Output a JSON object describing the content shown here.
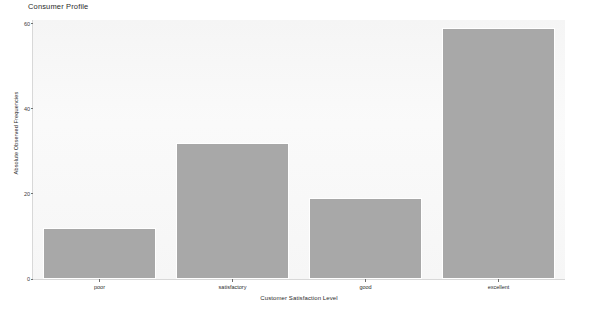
{
  "chart_data": {
    "type": "bar",
    "title": "Consumer Profile",
    "xlabel": "Customer Satisfaction Level",
    "ylabel": "Absolute Observed Frequencies",
    "categories": [
      "poor",
      "satisfactory",
      "good",
      "excellent"
    ],
    "values": [
      12,
      32,
      19,
      59
    ],
    "yticks": [
      0,
      20,
      40,
      60
    ],
    "ytick_labels": [
      "0",
      "20",
      "40",
      "60"
    ],
    "ylim": [
      0,
      60.9
    ],
    "grid": false,
    "legend": false,
    "bar_color": "#a8a8a8",
    "bar_edge_color": "#ffffff",
    "plot_background": "#f7f7f7",
    "figure_background": "#ffffff",
    "text_color": "#2b2b2b"
  }
}
